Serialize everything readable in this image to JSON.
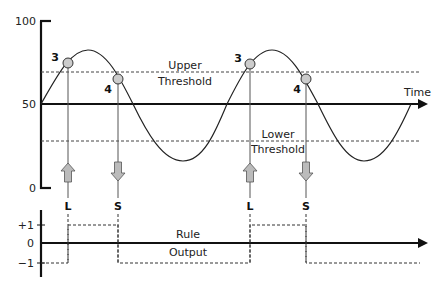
{
  "upper_chart": {
    "y_ticks": [
      {
        "label": "100",
        "value": 100
      },
      {
        "label": "50",
        "value": 50
      },
      {
        "label": "0",
        "value": 0
      }
    ],
    "x_axis_label": "Time",
    "upper_threshold_label_line1": "Upper",
    "upper_threshold_label_line2": "Threshold",
    "lower_threshold_label_line1": "Lower",
    "lower_threshold_label_line2": "Threshold",
    "upper_threshold_value": 70,
    "lower_threshold_value": 30,
    "markers": [
      {
        "label": "3",
        "type": "upper-cross-up"
      },
      {
        "label": "4",
        "type": "upper-cross-down"
      },
      {
        "label": "3",
        "type": "upper-cross-up"
      },
      {
        "label": "4",
        "type": "upper-cross-down"
      }
    ],
    "signals": [
      {
        "label": "L",
        "direction": "up"
      },
      {
        "label": "S",
        "direction": "down"
      },
      {
        "label": "L",
        "direction": "up"
      },
      {
        "label": "S",
        "direction": "down"
      }
    ]
  },
  "lower_chart": {
    "y_ticks": [
      {
        "label": "+1",
        "value": 1
      },
      {
        "label": "0",
        "value": 0
      },
      {
        "label": "−1",
        "value": -1
      }
    ],
    "rule_label_line1": "Rule",
    "rule_label_line2": "Output",
    "output_sequence": [
      -1,
      1,
      -1,
      1,
      -1
    ]
  },
  "colors": {
    "axis": "#111111",
    "curve": "#222222",
    "threshold": "#444444",
    "marker_fill": "#cccccc",
    "arrow_fill": "#bbbbbb"
  }
}
